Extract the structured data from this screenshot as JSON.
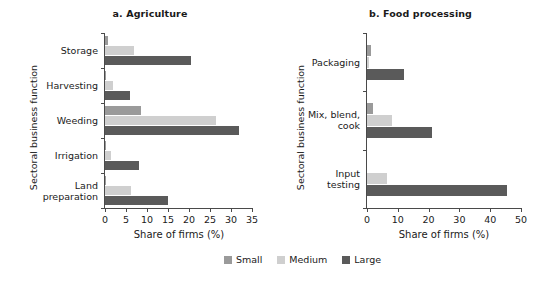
{
  "legend": {
    "items": [
      {
        "label": "Small",
        "color": "#9a9a9a"
      },
      {
        "label": "Medium",
        "color": "#cfcfcf"
      },
      {
        "label": "Large",
        "color": "#5a5a5a"
      }
    ]
  },
  "chart_data": [
    {
      "type": "bar",
      "orientation": "horizontal",
      "title": "a. Agriculture",
      "xlabel": "Share of firms (%)",
      "ylabel": "Sectoral business function",
      "xlim": [
        0,
        35
      ],
      "xticks": [
        0,
        5,
        10,
        15,
        20,
        25,
        30,
        35
      ],
      "xticklabels": [
        "0",
        "5",
        "10",
        "15",
        "20",
        "25",
        "30",
        "35"
      ],
      "grid": false,
      "legend_position": "bottom-center",
      "categories": [
        "Storage",
        "Harvesting",
        "Weeding",
        "Irrigation",
        "Land preparation"
      ],
      "series": [
        {
          "name": "Small",
          "values": [
            0.6,
            0.3,
            8.5,
            0.3,
            0.3
          ]
        },
        {
          "name": "Medium",
          "values": [
            7.0,
            2.0,
            26.5,
            1.4,
            6.2
          ]
        },
        {
          "name": "Large",
          "values": [
            20.5,
            6.0,
            32.0,
            8.0,
            15.0
          ]
        }
      ]
    },
    {
      "type": "bar",
      "orientation": "horizontal",
      "title": "b. Food processing",
      "xlabel": "Share of firms (%)",
      "ylabel": "Sectoral business function",
      "xlim": [
        0,
        50
      ],
      "xticks": [
        0,
        10,
        20,
        30,
        40,
        50
      ],
      "xticklabels": [
        "0",
        "10",
        "20",
        "30",
        "40",
        "50"
      ],
      "grid": false,
      "legend_position": "bottom-center",
      "categories": [
        "Packaging",
        "Mix, blend, cook",
        "Input testing"
      ],
      "series": [
        {
          "name": "Small",
          "values": [
            1.4,
            1.8,
            0.0
          ]
        },
        {
          "name": "Medium",
          "values": [
            0.8,
            8.0,
            6.6
          ]
        },
        {
          "name": "Large",
          "values": [
            12.0,
            21.0,
            45.5
          ]
        }
      ]
    }
  ]
}
